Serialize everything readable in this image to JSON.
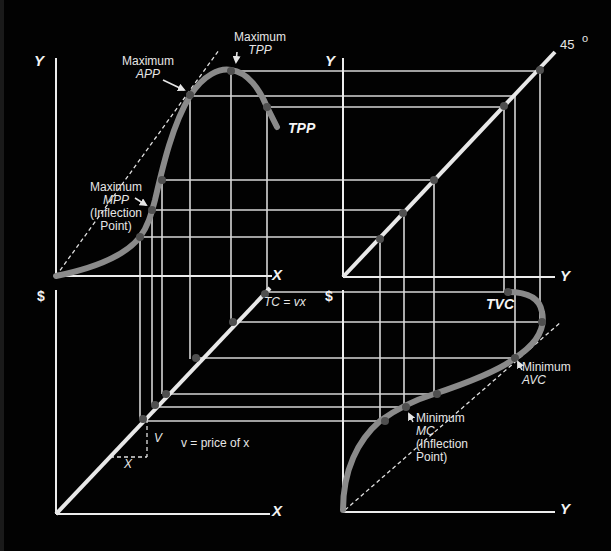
{
  "diagram": {
    "colors": {
      "background": "#000000",
      "axes": "#e8e8e8",
      "gridlines": "#d8d8d8",
      "curve": "#8a8a8a",
      "points": "#555555",
      "dashed": "#e0e0e0"
    },
    "quadrants": {
      "production": {
        "y_axis_label": "Y",
        "x_axis_label": "X",
        "curve_label": "TPP",
        "annotations": {
          "max_tpp_line1": "Maximum",
          "max_tpp_line2": "TPP",
          "max_app_line1": "Maximum",
          "max_app_line2": "APP",
          "max_mpp_line1": "Maximum",
          "max_mpp_line2": "MPP",
          "max_mpp_line3": "(Inflection",
          "max_mpp_line4": "Point)"
        }
      },
      "forty_five": {
        "y_axis_label": "Y",
        "x_axis_label": "Y",
        "angle_label": "45",
        "degree_symbol": "o"
      },
      "cost_line": {
        "y_axis_label": "$",
        "x_axis_label": "X",
        "line_label": "TC = vx",
        "slope_v": "V",
        "slope_x": "X",
        "note": "v = price of x"
      },
      "tvc": {
        "y_axis_label": "$",
        "x_axis_label": "Y",
        "curve_label": "TVC",
        "annotations": {
          "min_avc_line1": "Minimum",
          "min_avc_line2": "AVC",
          "min_mc_line1": "Minimum",
          "min_mc_line2": "MC",
          "min_mc_line3": "(Inflection",
          "min_mc_line4": "Point)"
        }
      }
    }
  }
}
